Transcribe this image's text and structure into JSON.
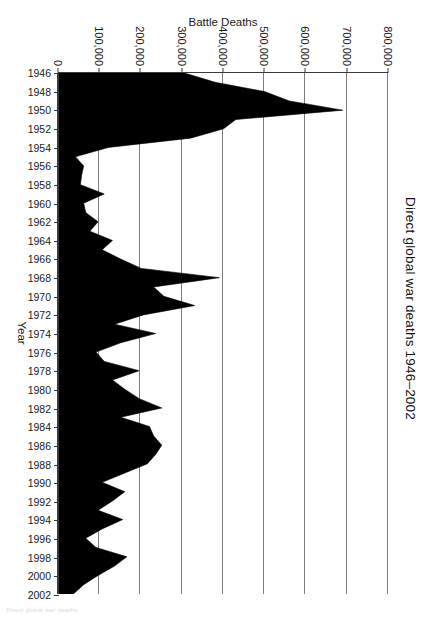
{
  "figure": {
    "title": "Direct global war deaths 1946–2002",
    "axis_color": "#3a3a3a",
    "grid_color": "#7d7d7d",
    "area_color": "#000000",
    "background": "#ffffff"
  },
  "x_axis": {
    "label": "Year",
    "tick_labels": [
      "1946",
      "1948",
      "1950",
      "1952",
      "1954",
      "1956",
      "1958",
      "1960",
      "1962",
      "1964",
      "1966",
      "1968",
      "1970",
      "1972",
      "1974",
      "1976",
      "1978",
      "1980",
      "1982",
      "1984",
      "1986",
      "1988",
      "1990",
      "1992",
      "1994",
      "1996",
      "1998",
      "2000",
      "2002"
    ],
    "range": [
      1946,
      2002
    ],
    "tick_step": 2
  },
  "y_axis": {
    "label": "Battle Deaths",
    "tick_labels": [
      "0",
      "100,000",
      "200,000",
      "300,000",
      "400,000",
      "500,000",
      "600,000",
      "700,000",
      "800,000"
    ],
    "tick_values": [
      0,
      100000,
      200000,
      300000,
      400000,
      500000,
      600000,
      700000,
      800000
    ],
    "range": [
      0,
      800000
    ]
  },
  "artifact": {
    "corner_text": "Direct global war deaths"
  },
  "chart_data": {
    "type": "area",
    "title": "Direct global war deaths 1946–2002",
    "xlabel": "Year",
    "ylabel": "Battle Deaths",
    "xlim": [
      1946,
      2002
    ],
    "ylim": [
      0,
      800000
    ],
    "grid": true,
    "legend": null,
    "orientation": "rotated-90-clockwise-on-page",
    "x": [
      1946,
      1947,
      1948,
      1949,
      1950,
      1951,
      1952,
      1953,
      1954,
      1955,
      1956,
      1957,
      1958,
      1959,
      1960,
      1961,
      1962,
      1963,
      1964,
      1965,
      1966,
      1967,
      1968,
      1969,
      1970,
      1971,
      1972,
      1973,
      1974,
      1975,
      1976,
      1977,
      1978,
      1979,
      1980,
      1981,
      1982,
      1983,
      1984,
      1985,
      1986,
      1987,
      1988,
      1989,
      1990,
      1991,
      1992,
      1993,
      1994,
      1995,
      1996,
      1997,
      1998,
      1999,
      2000,
      2001,
      2002
    ],
    "values": [
      305000,
      380000,
      500000,
      560000,
      690000,
      430000,
      400000,
      320000,
      120000,
      40000,
      60000,
      55000,
      52000,
      110000,
      60000,
      65000,
      95000,
      75000,
      130000,
      105000,
      150000,
      200000,
      390000,
      230000,
      255000,
      330000,
      205000,
      135000,
      235000,
      150000,
      90000,
      110000,
      195000,
      130000,
      160000,
      195000,
      250000,
      150000,
      220000,
      230000,
      250000,
      235000,
      215000,
      160000,
      105000,
      160000,
      130000,
      95000,
      155000,
      105000,
      65000,
      90000,
      165000,
      135000,
      95000,
      60000,
      35000
    ],
    "notes": [
      "Peak at 1950 (Korean War) ≈ 690,000",
      "Secondary peaks: 1968 (Vietnam) ≈ 390,000; 1971 ≈ 330,000; 1982 ≈ 250,000",
      "Declining trend after 1999 to ≈ 35,000 in 2002"
    ]
  }
}
